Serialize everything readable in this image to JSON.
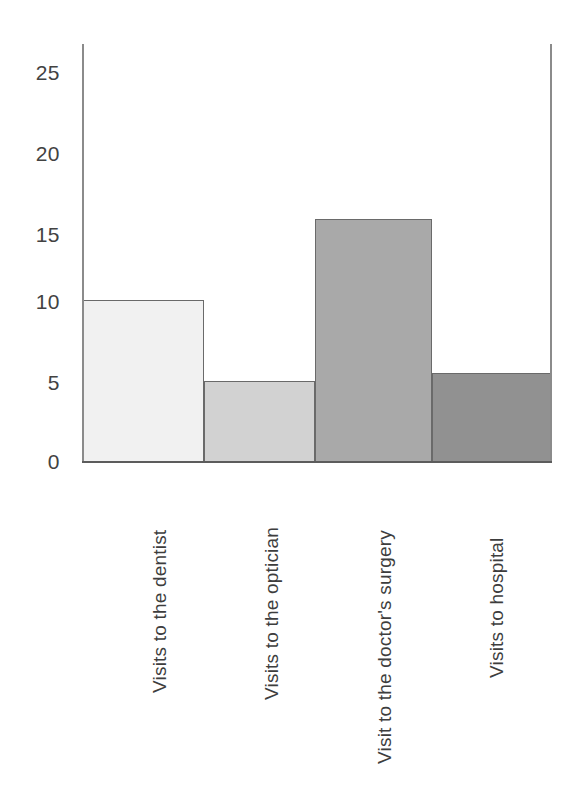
{
  "chart_data": {
    "type": "bar",
    "title": "",
    "subtitle": "",
    "xlabel": "",
    "ylabel": "",
    "categories": [
      "Visits to the dentist",
      "Visits to the optician",
      "Visit to the doctor's surgery",
      "Visits to hospital"
    ],
    "values": [
      10,
      5,
      15,
      5.5
    ],
    "ylim": [
      0,
      27
    ],
    "yticks": [
      0,
      5,
      10,
      15,
      20,
      25
    ],
    "ytick_labels": [
      "0",
      "5",
      "10",
      "15",
      "20",
      "25"
    ],
    "xtick_labels": [
      "Visits to the dentist",
      "Visits to the optician",
      "Visit to the doctor's surgery",
      "Visits to hospital"
    ],
    "grid": false,
    "legend": false,
    "legend_position": "none",
    "bar_style": "contiguous-histogram",
    "bar_colors": [
      "#f1f1f1",
      "#d2d2d2",
      "#a9a9a9",
      "#919191"
    ],
    "bar_edge_color": "#6a6a6a",
    "axis_color": "#7e7e7e",
    "baseline_color": "#5c5c5c",
    "background": "#ffffff"
  },
  "axes": {
    "y_ticks": [
      {
        "label": "25",
        "value": 25
      },
      {
        "label": "20",
        "value": 20
      },
      {
        "label": "15",
        "value": 15
      },
      {
        "label": "10",
        "value": 10
      },
      {
        "label": "5",
        "value": 5
      },
      {
        "label": "0",
        "value": 0
      }
    ]
  },
  "bars": [
    {
      "label": "Visits to the dentist",
      "value": 10,
      "color": "#f1f1f1"
    },
    {
      "label": "Visits to the optician",
      "value": 5,
      "color": "#d2d2d2"
    },
    {
      "label": "Visit to the doctor's surgery",
      "value": 15,
      "color": "#a9a9a9"
    },
    {
      "label": "Visits to hospital",
      "value": 5.5,
      "color": "#919191"
    }
  ]
}
